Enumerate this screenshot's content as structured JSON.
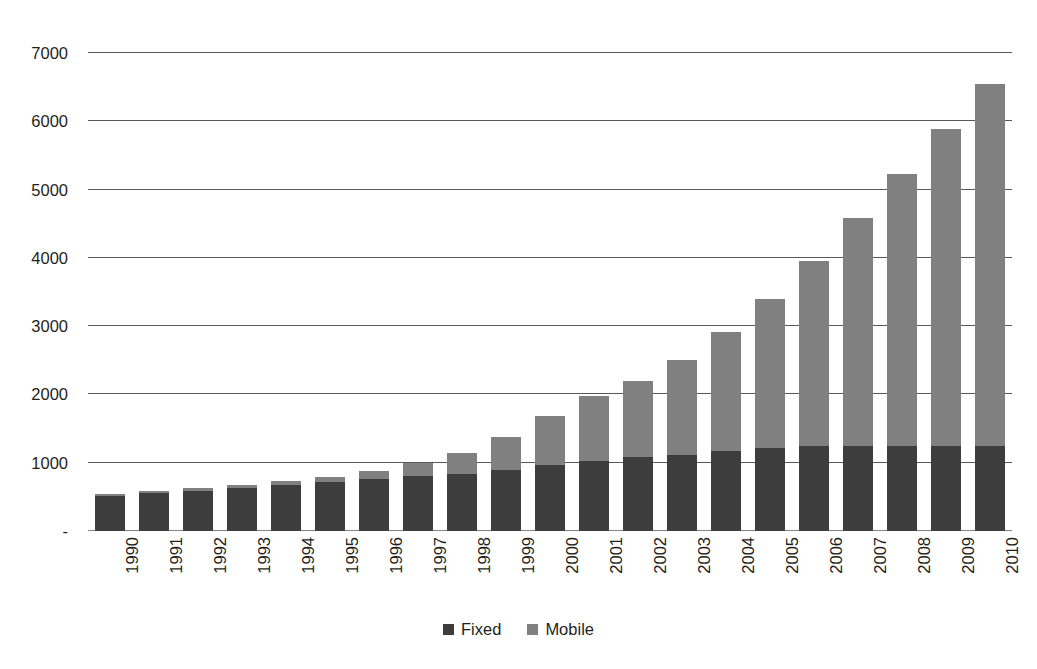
{
  "chart_data": {
    "type": "bar",
    "subtype": "stacked-vertical",
    "title": "",
    "subtitle": "",
    "xlabel": "",
    "ylabel": "",
    "ylim": [
      0,
      7000
    ],
    "ytick_values": [
      0,
      1000,
      2000,
      3000,
      4000,
      5000,
      6000,
      7000
    ],
    "ytick_labels": [
      "-",
      "1000",
      "2000",
      "3000",
      "4000",
      "5000",
      "6000",
      "7000"
    ],
    "grid": true,
    "grid_axis": "y",
    "legend_position": "bottom-center",
    "categories": [
      "1990",
      "1991",
      "1992",
      "1993",
      "1994",
      "1995",
      "1996",
      "1997",
      "1998",
      "1999",
      "2000",
      "2001",
      "2002",
      "2003",
      "2004",
      "2005",
      "2006",
      "2007",
      "2008",
      "2009",
      "2010"
    ],
    "series": [
      {
        "name": "Fixed",
        "color": "#3d3d3d",
        "values": [
          520,
          560,
          590,
          630,
          680,
          720,
          760,
          800,
          840,
          900,
          960,
          1030,
          1080,
          1110,
          1170,
          1210,
          1240,
          1250,
          1250,
          1250,
          1240
        ]
      },
      {
        "name": "Mobile",
        "color": "#808080",
        "values": [
          25,
          30,
          35,
          40,
          50,
          70,
          120,
          200,
          300,
          470,
          730,
          950,
          1120,
          1390,
          1740,
          2190,
          2720,
          3330,
          3980,
          4640,
          5300
        ]
      }
    ],
    "totals": [
      545,
      590,
      625,
      670,
      730,
      790,
      880,
      1000,
      1140,
      1370,
      1690,
      1980,
      2200,
      2500,
      2910,
      3400,
      3960,
      4580,
      5230,
      5890,
      6540
    ]
  },
  "legend": {
    "items": [
      {
        "label": "Fixed",
        "color": "#3d3d3d",
        "marker": "square-marker-icon"
      },
      {
        "label": "Mobile",
        "color": "#808080",
        "marker": "square-marker-icon"
      }
    ]
  },
  "axes": {
    "y": {
      "labels": [
        "7000",
        "6000",
        "5000",
        "4000",
        "3000",
        "2000",
        "1000",
        "-"
      ]
    }
  },
  "colors": {
    "background": "#ffffff",
    "gridline": "#58595b",
    "text": "#231f20",
    "fixed": "#3d3d3d",
    "mobile": "#808080"
  }
}
